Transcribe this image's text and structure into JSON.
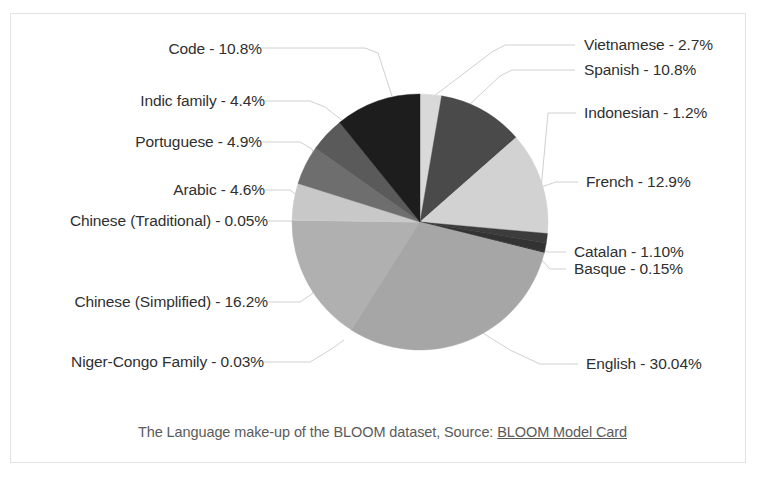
{
  "caption": {
    "text_before": "The Language make-up of the BLOOM dataset, Source: ",
    "link_text": "BLOOM Model Card"
  },
  "chart_data": {
    "type": "pie",
    "title": "",
    "xlabel": "",
    "ylabel": "",
    "units": "percent",
    "legend_position": "none",
    "labels_position": "outside-with-leader-lines",
    "start_angle_deg": 0,
    "direction": "clockwise",
    "categories": [
      "Vietnamese",
      "Spanish",
      "French",
      "Indonesian",
      "Catalan",
      "Basque",
      "English",
      "Niger-Congo Family",
      "Chinese (Simplified)",
      "Chinese (Traditional)",
      "Arabic",
      "Portuguese",
      "Indic family",
      "Code"
    ],
    "values": [
      2.7,
      10.8,
      12.9,
      1.2,
      1.1,
      0.15,
      30.04,
      0.03,
      16.2,
      0.05,
      4.6,
      4.9,
      4.4,
      10.8
    ],
    "value_labels": [
      "2.7%",
      "10.8%",
      "12.9%",
      "1.2%",
      "1.10%",
      "0.15%",
      "30.04%",
      "0.03%",
      "16.2%",
      "0.05%",
      "4.6%",
      "4.9%",
      "4.4%",
      "10.8%"
    ],
    "slice_colors": [
      "#d9d9d9",
      "#4a4a4a",
      "#d2d2d2",
      "#3c3c3c",
      "#333333",
      "#2b2b2b",
      "#a6a6a6",
      "#9b9b9b",
      "#b0b0b0",
      "#cfcfcf",
      "#c8c8c8",
      "#6e6e6e",
      "#5a5a5a",
      "#1d1d1d"
    ]
  },
  "labels": {
    "code": "Code - 10.8%",
    "indic": "Indic family - 4.4%",
    "portuguese": "Portuguese - 4.9%",
    "arabic": "Arabic - 4.6%",
    "chinese_traditional": "Chinese (Traditional) - 0.05%",
    "chinese_simplified": "Chinese (Simplified) - 16.2%",
    "niger_congo": "Niger-Congo Family - 0.03%",
    "vietnamese": "Vietnamese - 2.7%",
    "spanish": "Spanish - 10.8%",
    "indonesian": "Indonesian - 1.2%",
    "french": "French - 12.9%",
    "catalan": "Catalan - 1.10%",
    "basque": "Basque - 0.15%",
    "english": "English - 30.04%"
  },
  "colors": {
    "frame_border": "#e2e2e2",
    "leader_line": "#d0d0d0",
    "label_text": "#2f2f2f",
    "caption_text": "#5b5b5b",
    "background": "#ffffff"
  }
}
